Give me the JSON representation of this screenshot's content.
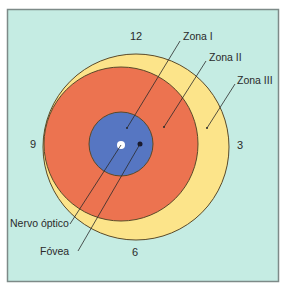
{
  "colors": {
    "background": "#c5ece3",
    "frame": "#7d8a88",
    "zone_III": "#fce48a",
    "zone_II": "#ec7350",
    "zone_I": "#5676c2",
    "optic_nerve": "#ffffff",
    "fovea": "#1a1a2e",
    "outline": "#5a4a2a",
    "leader": "#2a2a2a"
  },
  "clock_labels": {
    "twelve": "12",
    "three": "3",
    "six": "6",
    "nine": "9"
  },
  "labels": {
    "zone_I": "Zona I",
    "zone_II": "Zona II",
    "zone_III": "Zona III",
    "optic_nerve": "Nervo óptico",
    "fovea": "Fóvea"
  }
}
